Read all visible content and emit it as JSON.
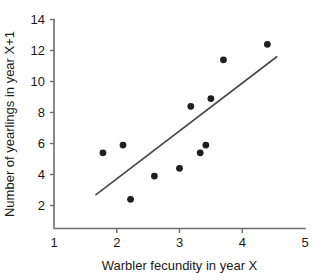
{
  "chart_data": {
    "type": "scatter",
    "title": "",
    "xlabel": "Warbler fecundity in year X",
    "ylabel": "Number of yearlings in year X+1",
    "xlim": [
      1,
      5
    ],
    "ylim": [
      0.7,
      14
    ],
    "xticks": [
      1,
      2,
      3,
      4,
      5
    ],
    "yticks": [
      2,
      4,
      6,
      8,
      10,
      12,
      14
    ],
    "xtick_labels": [
      "1",
      "2",
      "3",
      "4",
      "5"
    ],
    "ytick_labels": [
      "2",
      "4",
      "6",
      "8",
      "10",
      "12",
      "14"
    ],
    "grid": false,
    "legend": null,
    "points": [
      {
        "x": 1.78,
        "y": 5.4
      },
      {
        "x": 2.1,
        "y": 5.9
      },
      {
        "x": 2.22,
        "y": 2.4
      },
      {
        "x": 2.6,
        "y": 3.9
      },
      {
        "x": 3.0,
        "y": 4.4
      },
      {
        "x": 3.18,
        "y": 8.4
      },
      {
        "x": 3.33,
        "y": 5.4
      },
      {
        "x": 3.42,
        "y": 5.9
      },
      {
        "x": 3.5,
        "y": 8.9
      },
      {
        "x": 3.7,
        "y": 11.4
      },
      {
        "x": 4.4,
        "y": 12.4
      }
    ],
    "trend_line": {
      "x1": 1.67,
      "y1": 2.7,
      "x2": 4.55,
      "y2": 11.6
    },
    "marker_size": 3.4,
    "colors": {
      "marker": "#1f1f1f",
      "line": "#4a4a4a",
      "axis": "#6e6e6e",
      "text": "#1a1a1a",
      "background": "#ffffff"
    }
  }
}
